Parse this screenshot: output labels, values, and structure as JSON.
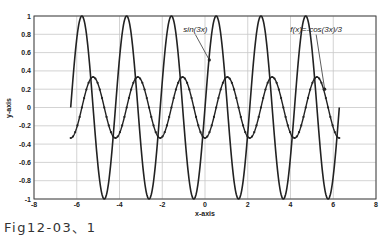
{
  "chart_data": {
    "type": "line",
    "title": "",
    "xlabel": "x-axis",
    "ylabel": "y-axis",
    "xlim": [
      -8,
      8
    ],
    "ylim": [
      -1,
      1
    ],
    "xticks": [
      -8,
      -6,
      -4,
      -2,
      0,
      2,
      4,
      6,
      8
    ],
    "yticks": [
      -1,
      -0.8,
      -0.6,
      -0.4,
      -0.2,
      0,
      0.2,
      0.4,
      0.6,
      0.8,
      1
    ],
    "grid": true,
    "legend": null,
    "x_range": [
      -6.2832,
      6.2832
    ],
    "series": [
      {
        "name": "sin(3x)",
        "expression": "sin(3x)",
        "style": "solid line",
        "color": "#222222"
      },
      {
        "name": "f(x)=-cos(3x)/3",
        "expression": "-cos(3x)/3",
        "style": "line with dot markers",
        "color": "#222222"
      }
    ],
    "annotations": [
      {
        "text": "sin(3x)",
        "text_x": -0.45,
        "text_y": 0.83,
        "arrow_to_x": 0.2,
        "arrow_to_y": 0.52
      },
      {
        "text": "f(x)=-cos(3x)/3",
        "text_x": 5.2,
        "text_y": 0.83,
        "arrow_to_x": 5.6,
        "arrow_to_y": 0.2
      }
    ]
  },
  "caption": "Fig12-03、1"
}
